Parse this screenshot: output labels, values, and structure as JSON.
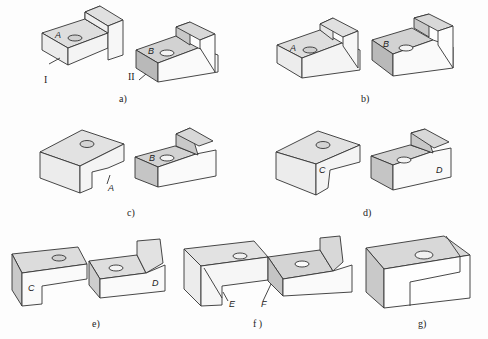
{
  "figure": {
    "panels": [
      {
        "id": "a",
        "caption": "a)",
        "labels": [
          "A",
          "B",
          "I",
          "II"
        ]
      },
      {
        "id": "b",
        "caption": "b)",
        "labels": [
          "A",
          "B"
        ]
      },
      {
        "id": "c",
        "caption": "c)",
        "labels": [
          "A",
          "B"
        ]
      },
      {
        "id": "d",
        "caption": "d)",
        "labels": [
          "C",
          "D"
        ]
      },
      {
        "id": "e",
        "caption": "e)",
        "labels": [
          "C",
          "D"
        ]
      },
      {
        "id": "f",
        "caption": "f )",
        "labels": [
          "E",
          "F"
        ]
      },
      {
        "id": "g",
        "caption": "g)",
        "labels": []
      }
    ]
  },
  "colors": {
    "top": "#d6d6d6",
    "side_light": "#ececec",
    "side_dark": "#bdbdbd",
    "front": "#ffffff",
    "stroke": "#333333"
  }
}
